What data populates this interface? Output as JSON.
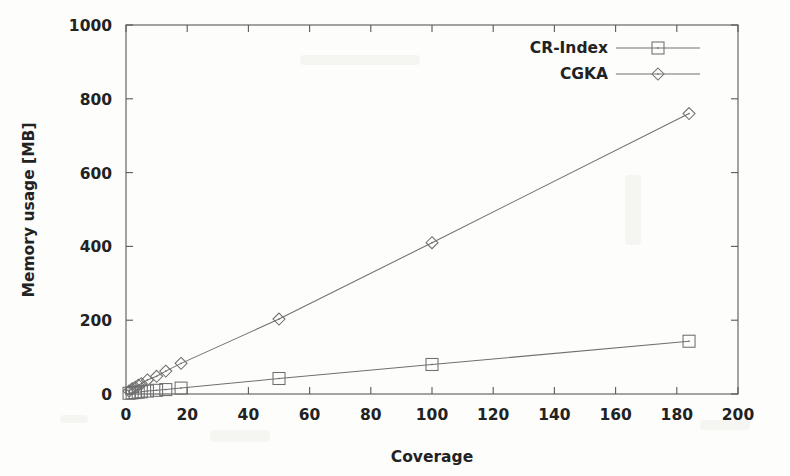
{
  "chart_data": {
    "type": "line",
    "title": "",
    "subtitle": "",
    "xlabel": "Coverage",
    "ylabel": "Memory usage [MB]",
    "xlim": [
      0,
      200
    ],
    "ylim": [
      0,
      1000
    ],
    "xticks": [
      0,
      20,
      40,
      60,
      80,
      100,
      120,
      140,
      160,
      180,
      200
    ],
    "xtick_labels": [
      "0",
      "20",
      "40",
      "60",
      "80",
      "100",
      "120",
      "140",
      "160",
      "180",
      "200"
    ],
    "yticks": [
      0,
      200,
      400,
      600,
      800,
      1000
    ],
    "ytick_labels": [
      "0",
      "200",
      "400",
      "600",
      "800",
      "1000"
    ],
    "grid": false,
    "legend_position": "top-right",
    "series": [
      {
        "name": "CR-Index",
        "marker": "square",
        "color": "#6e6e6e",
        "points": [
          {
            "x": 1,
            "y": 2
          },
          {
            "x": 2,
            "y": 3
          },
          {
            "x": 3,
            "y": 4
          },
          {
            "x": 4,
            "y": 5
          },
          {
            "x": 5,
            "y": 6
          },
          {
            "x": 7,
            "y": 8
          },
          {
            "x": 10,
            "y": 10
          },
          {
            "x": 13,
            "y": 12
          },
          {
            "x": 18,
            "y": 16
          },
          {
            "x": 50,
            "y": 42
          },
          {
            "x": 100,
            "y": 80
          },
          {
            "x": 184,
            "y": 143
          }
        ]
      },
      {
        "name": "CGKA",
        "marker": "diamond",
        "color": "#6e6e6e",
        "points": [
          {
            "x": 1,
            "y": 8
          },
          {
            "x": 2,
            "y": 14
          },
          {
            "x": 3,
            "y": 18
          },
          {
            "x": 4,
            "y": 24
          },
          {
            "x": 5,
            "y": 28
          },
          {
            "x": 7,
            "y": 38
          },
          {
            "x": 10,
            "y": 48
          },
          {
            "x": 13,
            "y": 62
          },
          {
            "x": 18,
            "y": 83
          },
          {
            "x": 50,
            "y": 203
          },
          {
            "x": 100,
            "y": 410
          },
          {
            "x": 184,
            "y": 760
          }
        ]
      }
    ],
    "legend": [
      {
        "label": "CR-Index",
        "marker": "square"
      },
      {
        "label": "CGKA",
        "marker": "diamond"
      }
    ]
  }
}
